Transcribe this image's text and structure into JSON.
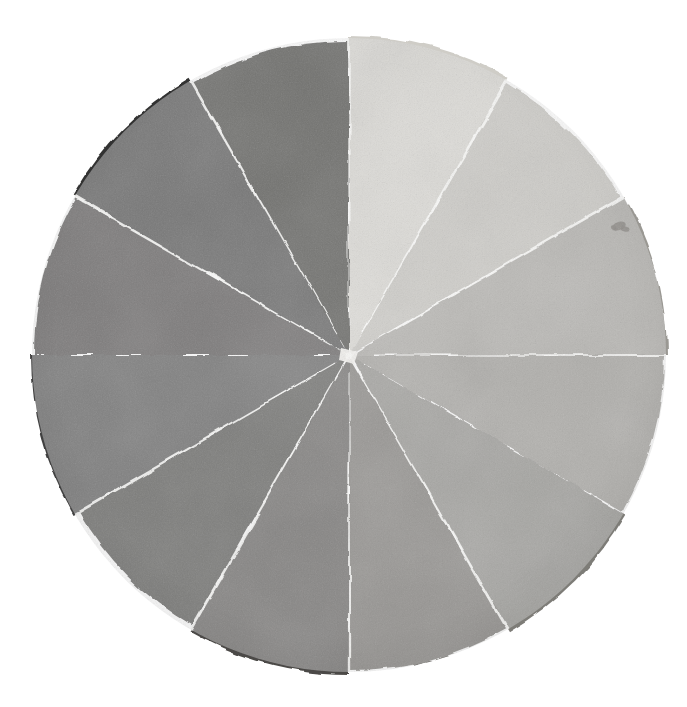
{
  "figure": {
    "name": "grayscale-value-wheel",
    "medium": "watercolor wash on torn paper collage",
    "background_color": "#ffffff",
    "gap_color": "#fdfdfb",
    "canvas": {
      "width": 687,
      "height": 707
    },
    "circle": {
      "center_x": 349,
      "center_y": 355,
      "radius": 317
    }
  },
  "chart_data": {
    "type": "pie",
    "xlabel": "",
    "ylabel": "",
    "legend": "none",
    "grid": false,
    "equal_slices": true,
    "slice_count": 12,
    "slice_degrees": 30,
    "start_angle_deg": -90,
    "categories": [
      "step-01",
      "step-02",
      "step-03",
      "step-04",
      "step-05",
      "step-06",
      "step-07",
      "step-08",
      "step-09",
      "step-10",
      "step-11",
      "step-12"
    ],
    "values": [
      8.333,
      8.333,
      8.333,
      8.333,
      8.333,
      8.333,
      8.333,
      8.333,
      8.333,
      8.333,
      8.333,
      8.333
    ],
    "colors": [
      "#cfcdc7",
      "#b9b7b1",
      "#9a9893",
      "#8d8b86",
      "#7d7b77",
      "#66645f",
      "#4b4946",
      "#3b3a38",
      "#414040",
      "#3a3937",
      "#313130",
      "#2b2a28"
    ],
    "slices": [
      {
        "id": "step-01",
        "label": "value 1 — lightest",
        "start_deg": -90,
        "end_deg": -60,
        "color": "#cfcdc7",
        "luminance": 0.81
      },
      {
        "id": "step-02",
        "label": "value 2",
        "start_deg": -60,
        "end_deg": -30,
        "color": "#b9b7b1",
        "luminance": 0.72
      },
      {
        "id": "step-03",
        "label": "value 3",
        "start_deg": -30,
        "end_deg": 0,
        "color": "#9a9893",
        "luminance": 0.6
      },
      {
        "id": "step-04",
        "label": "value 4",
        "start_deg": 0,
        "end_deg": 30,
        "color": "#8d8b86",
        "luminance": 0.55
      },
      {
        "id": "step-05",
        "label": "value 5",
        "start_deg": 30,
        "end_deg": 60,
        "color": "#7d7b77",
        "luminance": 0.48
      },
      {
        "id": "step-06",
        "label": "value 6",
        "start_deg": 60,
        "end_deg": 90,
        "color": "#66645f",
        "luminance": 0.39
      },
      {
        "id": "step-07",
        "label": "value 7",
        "start_deg": 90,
        "end_deg": 120,
        "color": "#4b4946",
        "luminance": 0.29
      },
      {
        "id": "step-08",
        "label": "value 8",
        "start_deg": 120,
        "end_deg": 150,
        "color": "#3b3a38",
        "luminance": 0.23
      },
      {
        "id": "step-09",
        "label": "value 9",
        "start_deg": 150,
        "end_deg": 180,
        "color": "#414040",
        "luminance": 0.25
      },
      {
        "id": "step-10",
        "label": "value 10",
        "start_deg": 180,
        "end_deg": 210,
        "color": "#3a3937",
        "luminance": 0.22
      },
      {
        "id": "step-11",
        "label": "value 11",
        "start_deg": 210,
        "end_deg": 240,
        "color": "#313130",
        "luminance": 0.19
      },
      {
        "id": "step-12",
        "label": "value 12 — darkest",
        "start_deg": 240,
        "end_deg": 270,
        "color": "#2b2a28",
        "luminance": 0.16
      }
    ]
  },
  "artifacts": [
    {
      "id": "smudge-right",
      "label": "dark ink smudge",
      "x": 619,
      "y": 226,
      "color": "#5a5650"
    }
  ]
}
